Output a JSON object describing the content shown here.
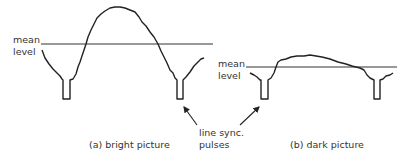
{
  "diagram": {
    "panel_a": {
      "mean_label_line1": "mean",
      "mean_label_line2": "level",
      "caption": "(a) bright picture"
    },
    "panel_b": {
      "mean_label_line1": "mean",
      "mean_label_line2": "level",
      "caption": "(b) dark picture"
    },
    "shared_label_line1": "line sync.",
    "shared_label_line2": "pulses",
    "colors": {
      "stroke": "#222222",
      "background": "#ffffff"
    }
  }
}
